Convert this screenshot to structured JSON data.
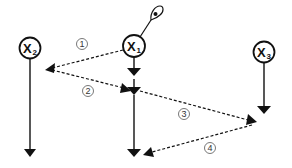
{
  "diagram": {
    "colors": {
      "stroke": "#111111",
      "background": "#ffffff",
      "step_label": "#333333"
    },
    "nodes": [
      {
        "id": "x2",
        "label": "X",
        "sub": "2",
        "cx": 30,
        "cy": 48
      },
      {
        "id": "x1",
        "label": "X",
        "sub": "1",
        "cx": 134,
        "cy": 46
      },
      {
        "id": "x3",
        "label": "X",
        "sub": "3",
        "cx": 264,
        "cy": 52
      }
    ],
    "observer_icon": "eye-icon",
    "steps": [
      {
        "number": "1",
        "from": "x1",
        "to": "x2-timeline"
      },
      {
        "number": "2",
        "from": "x2-timeline",
        "to": "x1-timeline"
      },
      {
        "number": "3",
        "from": "x1-timeline",
        "to": "x3-timeline"
      },
      {
        "number": "4",
        "from": "x3-timeline",
        "to": "x1-timeline"
      }
    ]
  }
}
